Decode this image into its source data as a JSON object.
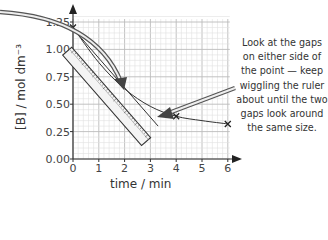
{
  "chart_data": {
    "type": "line",
    "title": "",
    "xlabel": "time / min",
    "ylabel": "[B] / mol dm⁻³",
    "xlim": [
      0,
      6
    ],
    "ylim": [
      0,
      1.25
    ],
    "x_ticks": [
      "0",
      "1",
      "2",
      "3",
      "4",
      "5",
      "6"
    ],
    "y_ticks": [
      "0.00",
      "0.25",
      "0.50",
      "0.75",
      "1.00",
      "1.25"
    ],
    "grid": true,
    "series": [
      {
        "name": "[B] curve",
        "x": [
          0,
          1,
          2,
          3,
          4,
          5,
          6
        ],
        "values": [
          1.2,
          0.88,
          0.64,
          0.48,
          0.39,
          0.35,
          0.32
        ]
      }
    ],
    "marked_points": [
      {
        "x": 0,
        "y": 1.2
      },
      {
        "x": 4,
        "y": 0.39
      },
      {
        "x": 6,
        "y": 0.32
      }
    ],
    "tangent_point": {
      "x": 2,
      "y": 0.64
    },
    "annotations": [
      "Look at the gaps on either side of the point — keep wiggling the ruler about until the two gaps look around the same size."
    ]
  },
  "labels": {
    "xlabel": "time / min",
    "ylabel": "[B] / mol dm⁻³"
  },
  "note_lines": [
    "Look at the gaps",
    "on either side of",
    "the point — keep",
    "wiggling the ruler",
    "about until the two",
    "gaps look around",
    "the same size."
  ]
}
